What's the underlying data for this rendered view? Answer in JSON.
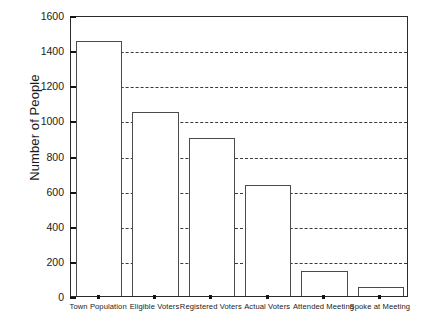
{
  "chart_data": {
    "type": "bar",
    "title": "",
    "xlabel": "",
    "ylabel": "Number of People",
    "categories": [
      "Town Population",
      "Eligible Voters",
      "Registered Voters",
      "Actual Voters",
      "Attended Meeting",
      "Spoke at Meeting"
    ],
    "values": [
      1450,
      1050,
      900,
      630,
      145,
      50
    ],
    "ylim": [
      0,
      1600
    ],
    "yticks": [
      0,
      200,
      400,
      600,
      800,
      1000,
      1200,
      1400,
      1600
    ],
    "ytick_labels": [
      "0",
      "200",
      "400",
      "600",
      "800",
      "1000",
      "1200",
      "1400",
      "1600"
    ],
    "grid": "horizontal-dashed",
    "legend": "none",
    "bar_facecolor": "#ffffff",
    "bar_edgecolor": "#4a4a4a",
    "axis_color": "#2b2b2b",
    "gridline_color": "#3a3a3a",
    "text_color": "#1b1b1b"
  }
}
